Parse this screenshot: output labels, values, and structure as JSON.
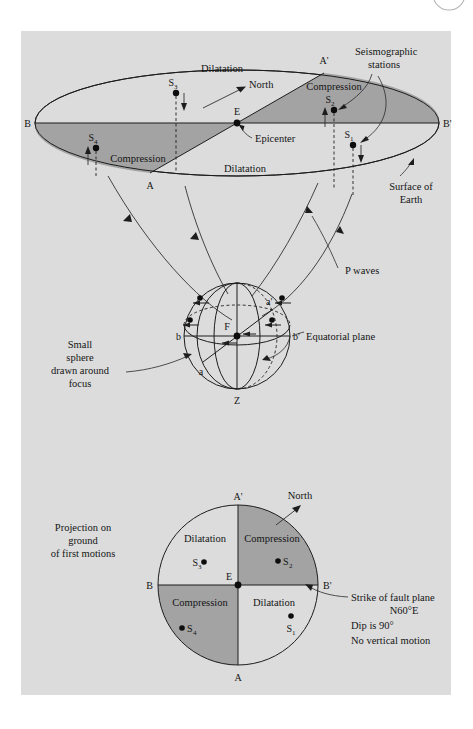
{
  "figure": {
    "background_color": "#dcdcdc",
    "page_color": "#ffffff",
    "shade_color": "#a3a3a3",
    "line_color": "#1d1d1d",
    "corner_mark": "partial-circle"
  },
  "top_block": {
    "name": "surface-of-earth-ellipse",
    "quadrant_labels": {
      "dilatation_upper": "Dilatation",
      "compression_upper": "Compression",
      "compression_lower": "Compression",
      "dilatation_lower": "Dilatation"
    },
    "axis_labels": {
      "b_left": "B",
      "b_right": "B'",
      "a_top": "A'",
      "a_bottom": "A"
    },
    "center_label": "E",
    "epicenter_label": "Epicenter",
    "north_label": "North",
    "stations": [
      {
        "id": "S3",
        "base": "S",
        "sub": "3"
      },
      {
        "id": "S2",
        "base": "S",
        "sub": "2"
      },
      {
        "id": "S1",
        "base": "S",
        "sub": "1"
      },
      {
        "id": "S4",
        "base": "S",
        "sub": "4"
      }
    ],
    "callouts": {
      "seismographic_stations_line1": "Seismographic",
      "seismographic_stations_line2": "stations",
      "surface_line1": "Surface of",
      "surface_line2": "Earth"
    }
  },
  "middle_block": {
    "name": "focal-sphere",
    "focus_label": "F",
    "zenith_label": "Z",
    "axis_labels": {
      "b_left": "b",
      "b_right": "b'",
      "a_upper": "a'",
      "a_lower": "a"
    },
    "callouts": {
      "equatorial_plane": "Equatorial plane",
      "p_waves": "P waves",
      "small_sphere_line1": "Small",
      "small_sphere_line2": "sphere",
      "small_sphere_line3": "drawn around",
      "small_sphere_line4": "focus"
    }
  },
  "bottom_block": {
    "name": "first-motion-projection",
    "quadrant_labels": {
      "dilatation_upper": "Dilatation",
      "compression_upper": "Compression",
      "compression_lower": "Compression",
      "dilatation_lower": "Dilatation"
    },
    "axis_labels": {
      "b_left": "B",
      "b_right": "B'",
      "a_top": "A'",
      "a_bottom": "A"
    },
    "center_label": "E",
    "north_label": "North",
    "stations": [
      {
        "id": "S3",
        "base": "S",
        "sub": "3"
      },
      {
        "id": "S2",
        "base": "S",
        "sub": "2"
      },
      {
        "id": "S1",
        "base": "S",
        "sub": "1"
      },
      {
        "id": "S4",
        "base": "S",
        "sub": "4"
      }
    ],
    "callouts": {
      "projection_line1": "Projection on",
      "projection_line2": "ground",
      "projection_line3": "of first motions",
      "strike_line1": "Strike of fault plane",
      "strike_line2": "N60°E",
      "strike_line3": "Dip is 90°",
      "strike_line4": "No vertical motion"
    }
  }
}
